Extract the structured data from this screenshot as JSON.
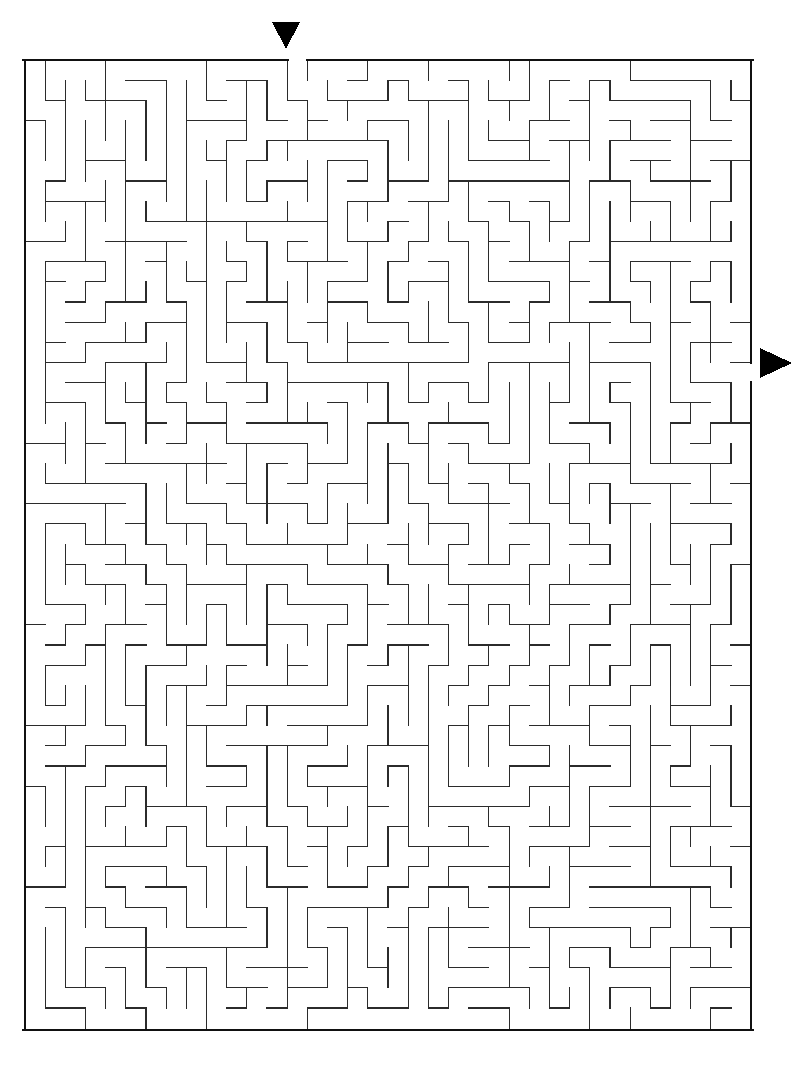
{
  "document": {
    "kind": "maze-puzzle",
    "title": "Maze",
    "background_color": "#ffffff",
    "canvas": {
      "width": 798,
      "height": 1066
    }
  },
  "maze": {
    "name": "rectangular-perfect-maze",
    "grid": {
      "columns": 36,
      "rows": 48
    },
    "geometry": {
      "origin_x": 25,
      "origin_y": 60,
      "cell_size": 20.17,
      "width": 726,
      "height": 970
    },
    "colors": {
      "wall": "#2b2b2b",
      "border": "#111111",
      "marker": "#000000",
      "background": "#ffffff"
    },
    "stroke": {
      "wall_width": 1.15,
      "border_width": 2.6
    },
    "seed": 20240517
  },
  "entrance": {
    "label": "entrance",
    "side": "top",
    "column": 13,
    "gap_cells": 1,
    "marker": {
      "icon": "triangle-down-icon",
      "center_x": 286,
      "tip_y": 49,
      "top_y": 22,
      "half_width": 14
    }
  },
  "exit": {
    "label": "exit",
    "side": "right",
    "row": 15,
    "gap_cells": 1,
    "marker": {
      "icon": "triangle-right-icon",
      "center_y": 363,
      "tip_x": 792,
      "left_x": 760,
      "half_height": 15
    }
  }
}
